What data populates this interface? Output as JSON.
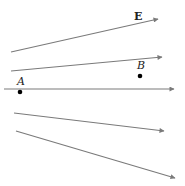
{
  "diagram": {
    "field_label": "E",
    "points": [
      {
        "name": "A",
        "x": 20,
        "y": 92,
        "label_x": 17,
        "label_y": 85
      },
      {
        "name": "B",
        "x": 140,
        "y": 76,
        "label_x": 137,
        "label_y": 69
      }
    ],
    "field_lines": [
      {
        "x1": 11,
        "y1": 52,
        "x2": 158,
        "y2": 19
      },
      {
        "x1": 11,
        "y1": 71,
        "x2": 162,
        "y2": 57
      },
      {
        "x1": 4,
        "y1": 89,
        "x2": 174,
        "y2": 89
      },
      {
        "x1": 14,
        "y1": 113,
        "x2": 164,
        "y2": 131
      },
      {
        "x1": 16,
        "y1": 131,
        "x2": 175,
        "y2": 178
      }
    ],
    "colors": {
      "line": "#7a7a7a",
      "point": "#000000",
      "text": "#222222"
    }
  }
}
